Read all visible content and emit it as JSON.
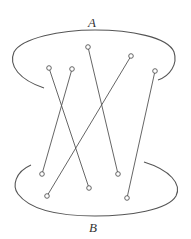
{
  "diagram": {
    "labels": {
      "top": "A",
      "bottom": "B"
    },
    "colors": {
      "stroke": "#555555",
      "background": "#ffffff"
    },
    "top_points": [
      {
        "id": "a1",
        "x": 49,
        "y": 68
      },
      {
        "id": "a2",
        "x": 72,
        "y": 69
      },
      {
        "id": "a3",
        "x": 88,
        "y": 47
      },
      {
        "id": "a4",
        "x": 131,
        "y": 56
      },
      {
        "id": "a5",
        "x": 155,
        "y": 71
      }
    ],
    "bottom_points": [
      {
        "id": "b1",
        "x": 42,
        "y": 174
      },
      {
        "id": "b2",
        "x": 47,
        "y": 196
      },
      {
        "id": "b3",
        "x": 89,
        "y": 188
      },
      {
        "id": "b4",
        "x": 118,
        "y": 174
      },
      {
        "id": "b5",
        "x": 127,
        "y": 198
      }
    ],
    "edges": [
      {
        "from": "a1",
        "to": "b3"
      },
      {
        "from": "a2",
        "to": "b1"
      },
      {
        "from": "a3",
        "to": "b4"
      },
      {
        "from": "a4",
        "to": "b2"
      },
      {
        "from": "a5",
        "to": "b5"
      }
    ]
  }
}
